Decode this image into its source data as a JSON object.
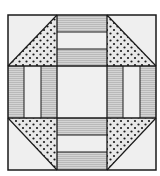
{
  "diagram": {
    "type": "quilt-block",
    "grid": "3x3",
    "colors": {
      "background": "#ffffff",
      "line": "#1a1a1a",
      "light_fabric": "#efefef",
      "striped_fabric": "#cfcfcf",
      "stripe_line": "#b0b0b0",
      "dotted_fabric": "#e6e6e6",
      "dot": "#1a1a1a"
    },
    "cells": [
      {
        "pos": "top-left",
        "kind": "half-square-triangle",
        "light": "upper-left",
        "dotted": "lower-right"
      },
      {
        "pos": "top-center",
        "kind": "three-strip-horizontal",
        "order": [
          "striped",
          "light",
          "striped"
        ]
      },
      {
        "pos": "top-right",
        "kind": "half-square-triangle",
        "light": "upper-right",
        "dotted": "lower-left"
      },
      {
        "pos": "middle-left",
        "kind": "three-strip-vertical",
        "order": [
          "striped",
          "light",
          "striped"
        ]
      },
      {
        "pos": "center",
        "kind": "plain",
        "fabric": "light"
      },
      {
        "pos": "middle-right",
        "kind": "three-strip-vertical",
        "order": [
          "striped",
          "light",
          "striped"
        ]
      },
      {
        "pos": "bottom-left",
        "kind": "half-square-triangle",
        "light": "lower-left",
        "dotted": "upper-right"
      },
      {
        "pos": "bottom-center",
        "kind": "three-strip-horizontal",
        "order": [
          "striped",
          "light",
          "striped"
        ]
      },
      {
        "pos": "bottom-right",
        "kind": "half-square-triangle",
        "light": "lower-right",
        "dotted": "upper-left"
      }
    ]
  }
}
